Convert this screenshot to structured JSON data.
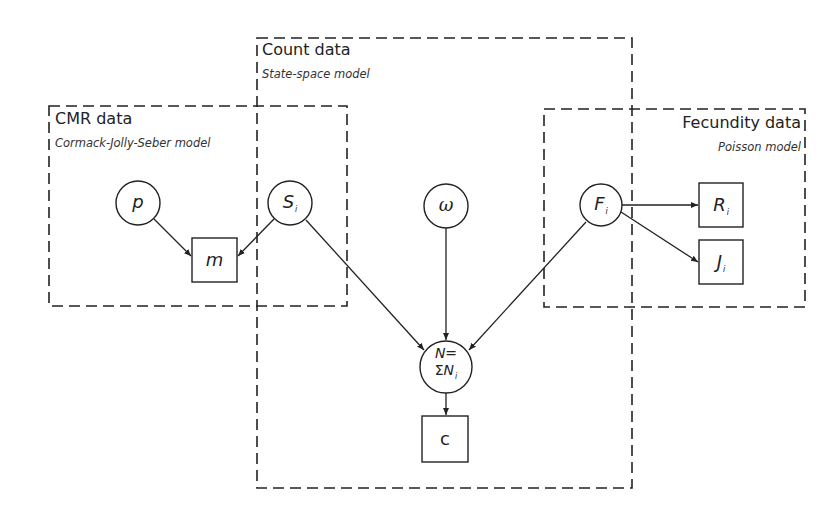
{
  "groups": {
    "count": {
      "title": "Count data",
      "subtitle": "State-space model"
    },
    "cmr": {
      "title": "CMR data",
      "subtitle": "Cormack-Jolly-Seber model"
    },
    "fecundity": {
      "title": "Fecundity data",
      "subtitle": "Poisson model"
    }
  },
  "nodes": {
    "p": {
      "symbol": "p",
      "shape": "circle"
    },
    "S": {
      "symbol": "S",
      "subscript": "i",
      "shape": "circle"
    },
    "omega": {
      "symbol": "ω",
      "shape": "circle"
    },
    "F": {
      "symbol": "F",
      "subscript": "i",
      "shape": "circle"
    },
    "m": {
      "symbol": "m",
      "shape": "square"
    },
    "N": {
      "line1": "N=",
      "line2_sigma": "Σ",
      "line2_symbol": "N",
      "subscript": "i",
      "shape": "circle"
    },
    "c": {
      "symbol": "c",
      "shape": "square"
    },
    "R": {
      "symbol": "R",
      "subscript": "i",
      "shape": "square"
    },
    "J": {
      "symbol": "J",
      "subscript": "i",
      "shape": "square"
    }
  },
  "edges": [
    {
      "from": "p",
      "to": "m"
    },
    {
      "from": "S",
      "to": "m"
    },
    {
      "from": "S",
      "to": "N"
    },
    {
      "from": "omega",
      "to": "N"
    },
    {
      "from": "F",
      "to": "N"
    },
    {
      "from": "F",
      "to": "R"
    },
    {
      "from": "F",
      "to": "J"
    },
    {
      "from": "N",
      "to": "c"
    }
  ]
}
